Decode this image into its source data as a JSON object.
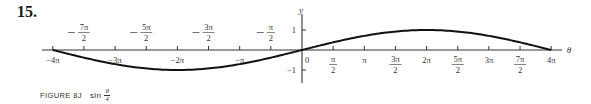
{
  "problem_number": "15.",
  "caption": {
    "label": "FIGURE 8J",
    "function_prefix": "sin",
    "function_num": "θ",
    "function_den": "4"
  },
  "chart_data": {
    "type": "line",
    "xlabel": "θ",
    "ylabel": "y",
    "xlim": [
      -12.566,
      12.566
    ],
    "ylim": [
      -1,
      1
    ],
    "grid": false,
    "legend": null,
    "x_ticks_below": [
      {
        "value": -12.566,
        "label": "−4π"
      },
      {
        "value": -9.425,
        "label": "−3π"
      },
      {
        "value": -6.283,
        "label": "−2π"
      },
      {
        "value": -3.142,
        "label": "−π"
      },
      {
        "value": 0,
        "label": "0"
      },
      {
        "value": 1.571,
        "label": "π/2"
      },
      {
        "value": 3.142,
        "label": "π"
      },
      {
        "value": 4.712,
        "label": "3π/2"
      },
      {
        "value": 6.283,
        "label": "2π"
      },
      {
        "value": 7.854,
        "label": "5π/2"
      },
      {
        "value": 9.425,
        "label": "3π"
      },
      {
        "value": 10.996,
        "label": "7π/2"
      },
      {
        "value": 12.566,
        "label": "4π"
      }
    ],
    "x_ticks_above": [
      {
        "value": -10.996,
        "label": "−7π/2"
      },
      {
        "value": -7.854,
        "label": "−5π/2"
      },
      {
        "value": -4.712,
        "label": "−3π/2"
      },
      {
        "value": -1.571,
        "label": "−π/2"
      }
    ],
    "y_ticks": [
      {
        "value": 1,
        "label": "1"
      },
      {
        "value": -1,
        "label": "−1"
      }
    ],
    "series": [
      {
        "name": "sin(θ/4)",
        "x": [
          -12.566,
          -10.996,
          -9.425,
          -7.854,
          -6.283,
          -4.712,
          -3.142,
          -1.571,
          0,
          1.571,
          3.142,
          4.712,
          6.283,
          7.854,
          9.425,
          10.996,
          12.566
        ],
        "values": [
          0,
          -0.383,
          -0.707,
          -0.924,
          -1,
          -0.924,
          -0.707,
          -0.383,
          0,
          0.383,
          0.707,
          0.924,
          1,
          0.924,
          0.707,
          0.383,
          0
        ]
      }
    ]
  }
}
